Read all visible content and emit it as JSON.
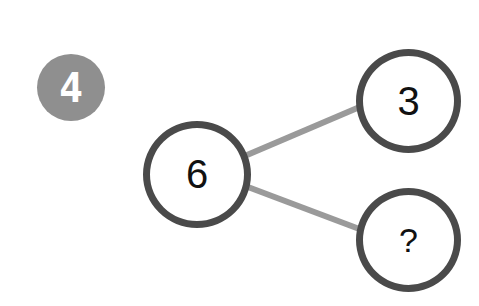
{
  "badge": {
    "number": "4",
    "color": "#8f8f8f"
  },
  "diagram": {
    "type": "number-bond",
    "whole": {
      "label": "6"
    },
    "parts": [
      {
        "label": "3"
      },
      {
        "label": "?"
      }
    ],
    "circle_stroke_color": "#4a4a4a",
    "connector_color": "#9a9a9a"
  }
}
